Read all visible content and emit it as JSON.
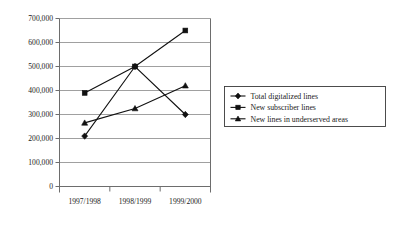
{
  "chart_data": {
    "type": "line",
    "title": "",
    "xlabel": "",
    "ylabel": "",
    "categories": [
      "1997/1998",
      "1998/1999",
      "1999/2000"
    ],
    "ylim": [
      0,
      700000
    ],
    "ytick_labels": [
      "0",
      "100,000",
      "200,000",
      "300,000",
      "400,000",
      "500,000",
      "600,000",
      "700,000"
    ],
    "ytick_values": [
      0,
      100000,
      200000,
      300000,
      400000,
      500000,
      600000,
      700000
    ],
    "grid": "horizontal",
    "legend_position": "right",
    "series": [
      {
        "name": "Total digitalized lines",
        "marker": "diamond",
        "values": [
          210000,
          500000,
          300000
        ]
      },
      {
        "name": "New subscriber lines",
        "marker": "square",
        "values": [
          390000,
          500000,
          650000
        ]
      },
      {
        "name": "New lines in underserved areas",
        "marker": "triangle",
        "values": [
          265000,
          325000,
          420000
        ]
      }
    ]
  },
  "colors": {
    "line": "#111111",
    "grid": "#888888",
    "axis": "#6d6d6d",
    "background": "#ffffff",
    "text": "#1a1a1a"
  }
}
